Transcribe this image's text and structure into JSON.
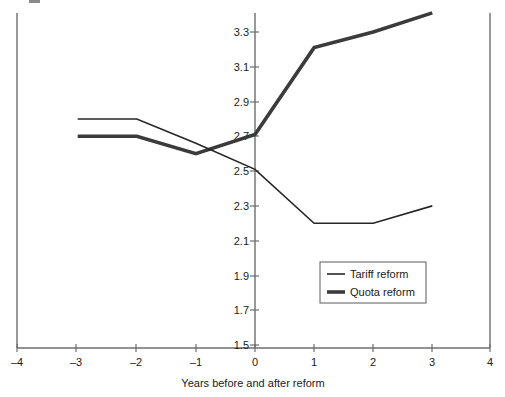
{
  "chart_data": {
    "type": "line",
    "title": "",
    "subtitle": "",
    "xlabel": "Years before and after reform",
    "ylabel": "",
    "xlim": [
      -4,
      4
    ],
    "ylim": [
      1.5,
      3.4
    ],
    "grid": false,
    "legend_position": "inside-lower-right",
    "x": [
      -3,
      -2,
      -1,
      0,
      1,
      2,
      3
    ],
    "xticks": [
      -4,
      -3,
      -2,
      -1,
      0,
      1,
      2,
      3,
      4
    ],
    "xtick_labels": [
      "–4",
      "–3",
      "–2",
      "–1",
      "0",
      "1",
      "2",
      "3",
      "4"
    ],
    "yticks": [
      1.5,
      1.7,
      1.9,
      2.1,
      2.3,
      2.5,
      2.7,
      2.9,
      3.1,
      3.3
    ],
    "ytick_labels": [
      "1.5",
      "1.7",
      "1.9",
      "2.1",
      "2.3",
      "2.5",
      "2.7",
      "2.9",
      "3.1",
      "3.3"
    ],
    "series": [
      {
        "name": "Tariff reform",
        "style": "thin",
        "color": "#262626",
        "values": [
          2.8,
          2.8,
          2.66,
          2.51,
          2.2,
          2.2,
          2.3
        ]
      },
      {
        "name": "Quota reform",
        "style": "thick",
        "color": "#3b3b3b",
        "values": [
          2.7,
          2.7,
          2.6,
          2.71,
          3.21,
          3.3,
          3.41
        ]
      }
    ]
  },
  "axes": {
    "x_axis_title": "Years before and after reform"
  },
  "legend": {
    "entries": [
      {
        "label": "Tariff reform",
        "style": "thin"
      },
      {
        "label": "Quota reform",
        "style": "thick"
      }
    ]
  }
}
